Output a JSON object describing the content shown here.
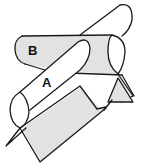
{
  "figure": {
    "labels": {
      "a": "A",
      "b": "B"
    },
    "colors": {
      "line": "#1a1a1a",
      "shade": "#e2e2e2",
      "background": "#ffffff"
    }
  }
}
